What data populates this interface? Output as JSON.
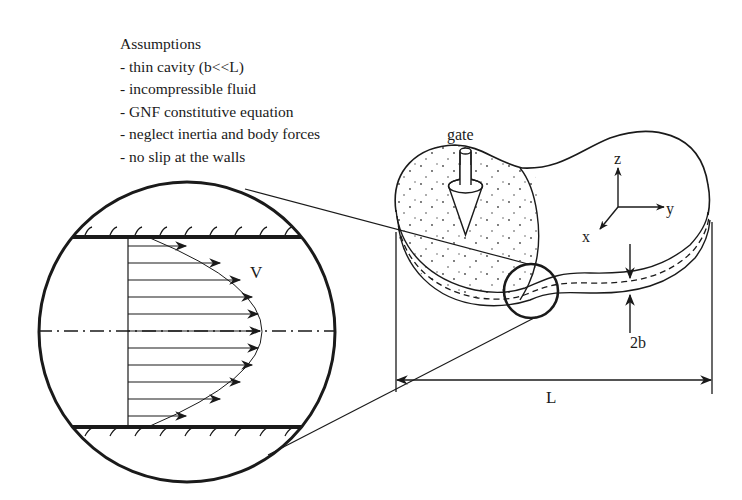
{
  "assumptions": {
    "title": "Assumptions",
    "items": [
      "- thin cavity (b<<L)",
      "- incompressible fluid",
      "- GNF constitutive equation",
      "- neglect inertia and body forces",
      "- no slip at the walls"
    ]
  },
  "labels": {
    "gate": "gate",
    "velocity": "V",
    "thickness": "2b",
    "length": "L",
    "axis_x": "x",
    "axis_y": "y",
    "axis_z": "z"
  },
  "colors": {
    "ink": "#1a1a1a",
    "background": "#ffffff"
  }
}
